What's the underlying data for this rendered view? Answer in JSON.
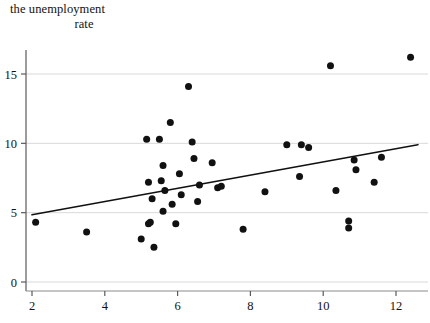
{
  "figure": {
    "title_line1": "the unemployment",
    "title_line2": "rate",
    "background_color": "#ffffff",
    "point_color": "#111111",
    "gridline_color": "#d9d9d9",
    "axis_color": "#8a8a8a",
    "trendline_color": "#111111"
  },
  "chart_data": {
    "type": "scatter",
    "title": "the unemployment rate",
    "xlabel": "",
    "ylabel": "",
    "xlim": [
      1.55,
      12.85
    ],
    "ylim": [
      -0.6,
      17.4
    ],
    "grid": true,
    "legend": "none",
    "xticks": [
      2,
      4,
      6,
      8,
      10,
      12
    ],
    "yticks": [
      0,
      5,
      10,
      15
    ],
    "xtick_labels": [
      "2",
      "4",
      "6",
      "8",
      "10",
      "12"
    ],
    "ytick_labels": [
      "0",
      "5",
      "10",
      "15"
    ],
    "series": [
      {
        "name": "observations",
        "marker": "circle",
        "points": [
          [
            2.1,
            4.3
          ],
          [
            3.5,
            3.6
          ],
          [
            5.0,
            3.1
          ],
          [
            5.15,
            10.3
          ],
          [
            5.2,
            7.2
          ],
          [
            5.2,
            4.2
          ],
          [
            5.25,
            4.3
          ],
          [
            5.3,
            6.0
          ],
          [
            5.35,
            2.5
          ],
          [
            5.5,
            10.3
          ],
          [
            5.55,
            7.3
          ],
          [
            5.6,
            8.4
          ],
          [
            5.6,
            5.1
          ],
          [
            5.65,
            6.6
          ],
          [
            5.8,
            11.5
          ],
          [
            5.85,
            5.6
          ],
          [
            5.95,
            4.2
          ],
          [
            6.05,
            7.8
          ],
          [
            6.1,
            6.3
          ],
          [
            6.3,
            14.1
          ],
          [
            6.4,
            10.1
          ],
          [
            6.45,
            8.9
          ],
          [
            6.55,
            5.8
          ],
          [
            6.6,
            7.0
          ],
          [
            6.95,
            8.6
          ],
          [
            7.1,
            6.8
          ],
          [
            7.2,
            6.9
          ],
          [
            7.8,
            3.8
          ],
          [
            8.4,
            6.5
          ],
          [
            9.0,
            9.9
          ],
          [
            9.35,
            7.6
          ],
          [
            9.4,
            9.9
          ],
          [
            9.6,
            9.7
          ],
          [
            10.2,
            15.6
          ],
          [
            10.35,
            6.6
          ],
          [
            10.7,
            4.4
          ],
          [
            10.7,
            3.9
          ],
          [
            10.85,
            8.8
          ],
          [
            10.9,
            8.1
          ],
          [
            11.4,
            7.2
          ],
          [
            11.6,
            9.0
          ],
          [
            12.4,
            16.2
          ]
        ]
      }
    ],
    "trendline": {
      "type": "linear-fit",
      "x_start": 2.0,
      "y_start": 4.85,
      "x_end": 12.6,
      "y_end": 9.9
    }
  }
}
